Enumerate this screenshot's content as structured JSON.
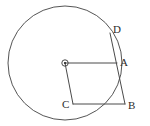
{
  "figure": {
    "kind": "circle-geometry-diagram",
    "width": 150,
    "height": 126,
    "background_color": "#ffffff",
    "stroke_color": "#4a4a4a",
    "label_color": "#2b2b2b"
  },
  "labels": {
    "point_a": "A",
    "point_b": "B",
    "point_c": "C",
    "point_d": "D"
  },
  "geometry": {
    "circle": {
      "center_x": 65,
      "center_y": 63,
      "radius": 57
    },
    "center_marker": {
      "ring_radius": 3.2,
      "dot_radius": 1.1
    },
    "points": {
      "center": {
        "x": 65,
        "y": 63
      },
      "A": {
        "x": 117,
        "y": 63
      },
      "B": {
        "x": 125,
        "y": 104
      },
      "C": {
        "x": 73,
        "y": 104
      },
      "D": {
        "x": 110,
        "y": 33
      }
    },
    "segments": [
      {
        "name": "radius-center-to-a",
        "from": "center",
        "to": "A"
      },
      {
        "name": "segment-center-to-c",
        "from": "center",
        "to": "C"
      },
      {
        "name": "segment-c-to-b",
        "from": "C",
        "to": "B"
      },
      {
        "name": "segment-b-to-d",
        "from": "B",
        "to": "D"
      }
    ]
  },
  "label_positions": {
    "A": {
      "left": 120,
      "top": 57
    },
    "B": {
      "left": 128,
      "top": 100
    },
    "C": {
      "left": 62,
      "top": 99
    },
    "D": {
      "left": 113,
      "top": 24
    }
  }
}
